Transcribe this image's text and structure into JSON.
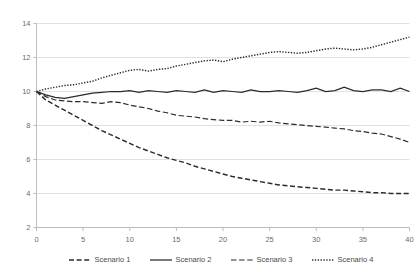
{
  "chart_data": {
    "type": "line",
    "title": "",
    "subtitle": "",
    "xlabel": "",
    "ylabel": "",
    "xlim": [
      0,
      40
    ],
    "ylim": [
      2,
      14
    ],
    "x_ticks": [
      0,
      5,
      10,
      15,
      20,
      25,
      30,
      35,
      40
    ],
    "y_ticks": [
      2,
      4,
      6,
      8,
      10,
      12,
      14
    ],
    "grid": "horizontal",
    "legend_position": "bottom",
    "x": [
      0,
      1,
      2,
      3,
      4,
      5,
      6,
      7,
      8,
      9,
      10,
      11,
      12,
      13,
      14,
      15,
      16,
      17,
      18,
      19,
      20,
      21,
      22,
      23,
      24,
      25,
      26,
      27,
      28,
      29,
      30,
      31,
      32,
      33,
      34,
      35,
      36,
      37,
      38,
      39,
      40
    ],
    "series": [
      {
        "name": "Scenario 1",
        "style": "dashed",
        "color": "#2b2b2b",
        "values": [
          10.0,
          9.5,
          9.2,
          8.9,
          8.6,
          8.3,
          8.0,
          7.7,
          7.45,
          7.2,
          6.95,
          6.7,
          6.5,
          6.3,
          6.1,
          5.95,
          5.8,
          5.6,
          5.45,
          5.3,
          5.15,
          5.0,
          4.9,
          4.8,
          4.7,
          4.6,
          4.5,
          4.45,
          4.4,
          4.35,
          4.3,
          4.25,
          4.2,
          4.2,
          4.15,
          4.1,
          4.05,
          4.05,
          4.0,
          4.0,
          4.0
        ]
      },
      {
        "name": "Scenario 2",
        "style": "solid",
        "color": "#2b2b2b",
        "values": [
          10.0,
          9.8,
          9.65,
          9.6,
          9.7,
          9.8,
          9.9,
          9.95,
          10.0,
          10.0,
          10.05,
          9.95,
          10.05,
          10.0,
          9.95,
          10.05,
          10.0,
          9.95,
          10.1,
          9.95,
          10.05,
          10.0,
          9.95,
          10.1,
          10.0,
          10.0,
          10.05,
          10.0,
          9.95,
          10.05,
          10.2,
          10.0,
          10.05,
          10.25,
          10.05,
          10.0,
          10.1,
          10.1,
          10.0,
          10.2,
          10.0
        ]
      },
      {
        "name": "Scenario 3",
        "style": "dashdot",
        "color": "#2b2b2b",
        "values": [
          10.0,
          9.7,
          9.5,
          9.45,
          9.4,
          9.4,
          9.35,
          9.3,
          9.4,
          9.35,
          9.2,
          9.1,
          9.0,
          8.85,
          8.75,
          8.6,
          8.55,
          8.5,
          8.4,
          8.35,
          8.3,
          8.3,
          8.2,
          8.25,
          8.2,
          8.25,
          8.15,
          8.1,
          8.05,
          8.0,
          7.95,
          7.9,
          7.85,
          7.8,
          7.7,
          7.65,
          7.55,
          7.5,
          7.35,
          7.2,
          7.0
        ]
      },
      {
        "name": "Scenario 4",
        "style": "dotted",
        "color": "#2b2b2b",
        "values": [
          10.0,
          10.15,
          10.25,
          10.35,
          10.4,
          10.5,
          10.6,
          10.8,
          10.95,
          11.1,
          11.25,
          11.3,
          11.2,
          11.3,
          11.35,
          11.5,
          11.6,
          11.7,
          11.8,
          11.85,
          11.75,
          11.9,
          12.0,
          12.1,
          12.2,
          12.3,
          12.35,
          12.3,
          12.25,
          12.3,
          12.4,
          12.5,
          12.55,
          12.5,
          12.45,
          12.5,
          12.6,
          12.75,
          12.9,
          13.05,
          13.2
        ]
      }
    ]
  },
  "legend": {
    "items": [
      {
        "label": "Scenario 1",
        "style": "dashed"
      },
      {
        "label": "Scenario 2",
        "style": "solid"
      },
      {
        "label": "Scenario 3",
        "style": "dashdot"
      },
      {
        "label": "Scenario 4",
        "style": "dotted"
      }
    ]
  }
}
